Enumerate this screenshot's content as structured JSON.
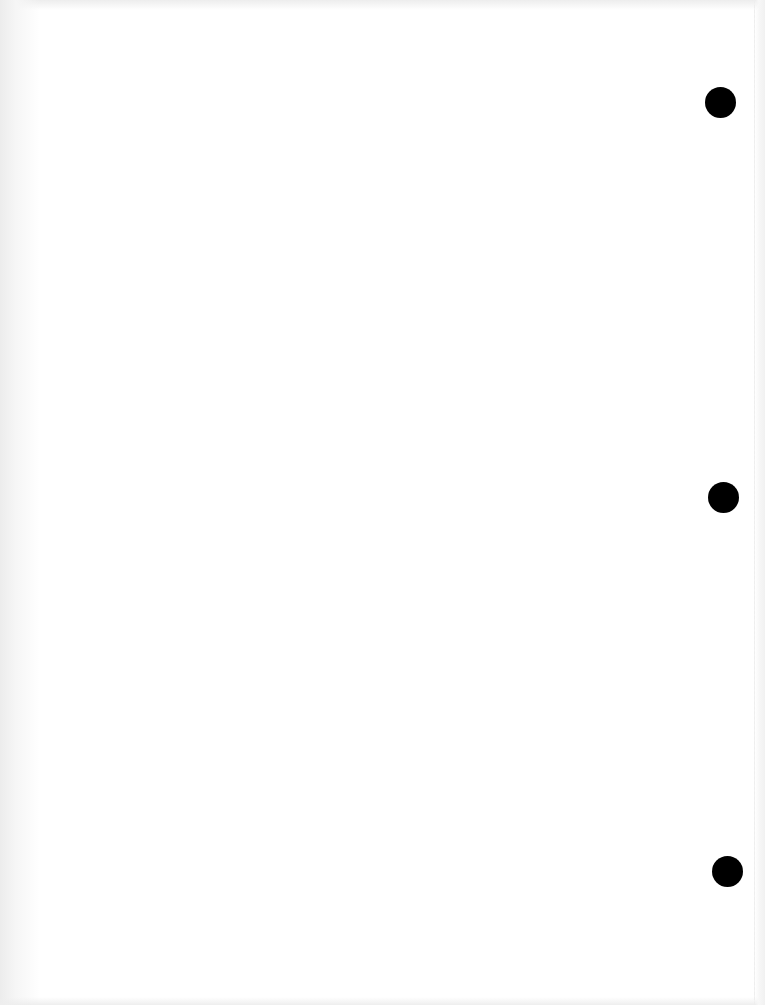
{
  "document": {
    "type": "blank-page",
    "background_color": "#ffffff",
    "text": "",
    "punch_holes": [
      {
        "name": "top",
        "color": "#000000"
      },
      {
        "name": "middle",
        "color": "#000000"
      },
      {
        "name": "bottom",
        "color": "#000000"
      }
    ]
  }
}
